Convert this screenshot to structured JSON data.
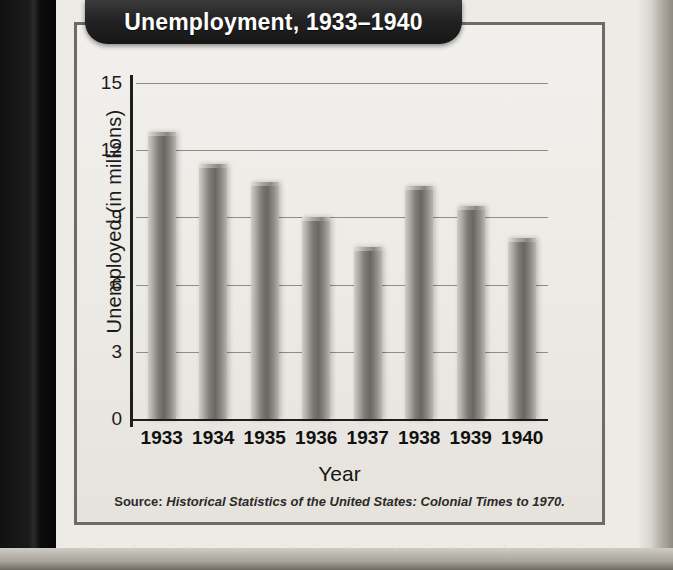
{
  "chart_data": {
    "type": "bar",
    "title": "Unemployment, 1933–1940",
    "xlabel": "Year",
    "ylabel": "Unemployed (in millions)",
    "categories": [
      "1933",
      "1934",
      "1935",
      "1936",
      "1937",
      "1938",
      "1939",
      "1940"
    ],
    "values": [
      12.8,
      11.4,
      10.6,
      9.0,
      7.7,
      10.4,
      9.5,
      8.1
    ],
    "ylim": [
      0,
      15
    ],
    "yticks": [
      0,
      3,
      6,
      9,
      12,
      15
    ],
    "ytick_labels": [
      "0",
      "3",
      "6",
      "9",
      "12",
      "15"
    ],
    "grid": true,
    "legend": "none",
    "bar_color": "#7e7b76",
    "source_label": "Source:",
    "source_title": "Historical Statistics of the United States: Colonial Times to 1970."
  },
  "style": {
    "title_bg": "#232323",
    "title_fg": "#ffffff",
    "frame_border": "#6d6b66",
    "page_bg": "#edebe6",
    "gridline_color": "#8e8c87",
    "axis_color": "#1e1e1e"
  }
}
